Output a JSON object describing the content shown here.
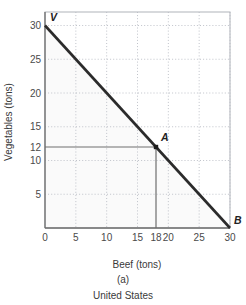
{
  "chart_data": {
    "type": "line",
    "title": "",
    "subtitle": "",
    "xlabel": "Beef (tons)",
    "ylabel": "Vegetables (tons)",
    "xlim": [
      0,
      30
    ],
    "ylim": [
      0,
      32
    ],
    "grid": true,
    "grid_style": "dotted",
    "legend": "none",
    "series": [
      {
        "name": "Production Possibilities Frontier",
        "x": [
          0,
          30
        ],
        "values": [
          30,
          0
        ],
        "color": "#2b2b2b"
      }
    ],
    "x_ticks": [
      0,
      5,
      10,
      15,
      18,
      20,
      25,
      30
    ],
    "y_ticks": [
      5,
      10,
      12,
      15,
      20,
      25,
      30
    ],
    "annotations": [
      {
        "label": "V",
        "x": 0,
        "y": 30,
        "note": "vertical intercept of frontier"
      },
      {
        "label": "A",
        "x": 18,
        "y": 12,
        "note": "production point with droplines"
      },
      {
        "label": "B",
        "x": 30,
        "y": 0,
        "note": "horizontal intercept of frontier"
      }
    ],
    "marker_points": [
      {
        "label": "A",
        "x": 18,
        "y": 12,
        "shape": "square",
        "color": "#1a1a1a"
      }
    ],
    "droplines": [
      {
        "from": [
          0,
          12
        ],
        "to": [
          18,
          12
        ],
        "color": "#6e6e6e"
      },
      {
        "from": [
          18,
          0
        ],
        "to": [
          18,
          12
        ],
        "color": "#6e6e6e"
      }
    ],
    "shaded_region": {
      "description": "feasible production set under the frontier",
      "color": "#fafafa"
    }
  },
  "caption": {
    "panel_letter": "(a)",
    "country": "United States"
  },
  "colors": {
    "frontier_line": "#2b2b2b",
    "grid_line": "#b9bcc4",
    "axis_line": "#6e6e6e",
    "frame_line": "#b0b3ba",
    "text": "#3a3a3a",
    "background": "#ffffff"
  }
}
